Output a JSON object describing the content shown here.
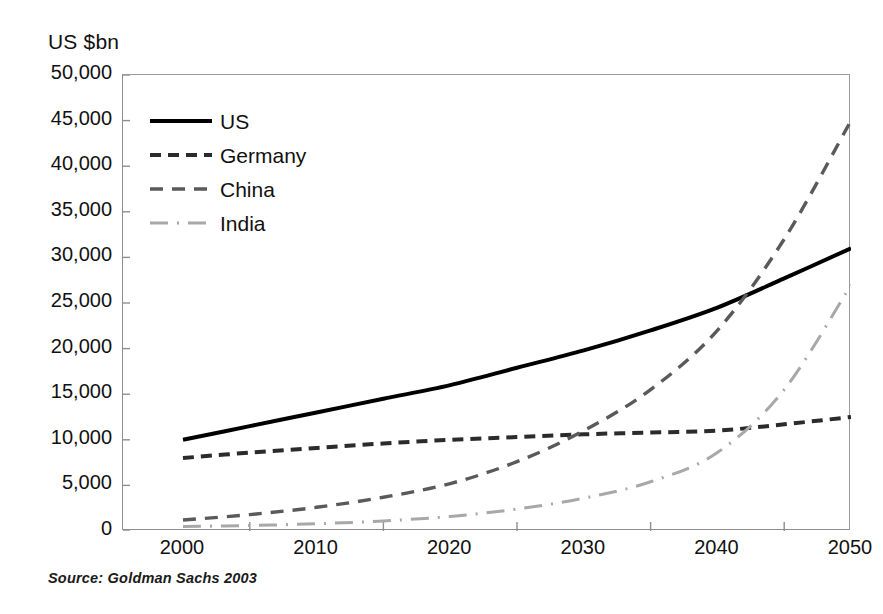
{
  "figure": {
    "y_axis_unit": "US $bn",
    "source_note": "Source:  Goldman Sachs 2003"
  },
  "legend": {
    "items": [
      {
        "label": "US",
        "style": "solid",
        "color": "#000000"
      },
      {
        "label": "Germany",
        "style": "dashed",
        "color": "#2b2b2b"
      },
      {
        "label": "China",
        "style": "dotted",
        "color": "#5a5a5a"
      },
      {
        "label": "India",
        "style": "dash-dot",
        "color": "#a8a8a8"
      }
    ]
  },
  "axes": {
    "y_ticks": [
      "50,000",
      "45,000",
      "40,000",
      "35,000",
      "30,000",
      "25,000",
      "20,000",
      "15,000",
      "10,000",
      "5,000",
      "0"
    ],
    "x_ticks": [
      "2000",
      "2010",
      "2020",
      "2030",
      "2040",
      "2050"
    ]
  },
  "chart_data": {
    "type": "line",
    "title": "",
    "subtitle": "",
    "xlabel": "",
    "ylabel": "US $bn",
    "xlim": [
      2000,
      2050
    ],
    "ylim": [
      0,
      50000
    ],
    "y_tick_step": 5000,
    "x_tick_step": 10,
    "grid": false,
    "legend_position": "upper-left-inside",
    "source": "Source:  Goldman Sachs 2003",
    "x": [
      2000,
      2005,
      2010,
      2015,
      2020,
      2025,
      2030,
      2035,
      2040,
      2045,
      2050
    ],
    "series": [
      {
        "name": "US",
        "line_style": "solid",
        "color": "#000000",
        "values": [
          10000,
          11500,
          13000,
          14500,
          16000,
          17900,
          19800,
          22000,
          24500,
          27700,
          31000
        ]
      },
      {
        "name": "Germany",
        "line_style": "dashed",
        "color": "#2b2b2b",
        "values": [
          8000,
          8600,
          9100,
          9600,
          10000,
          10300,
          10600,
          10800,
          11000,
          11700,
          12500
        ]
      },
      {
        "name": "China",
        "line_style": "dotted",
        "color": "#5a5a5a",
        "values": [
          1200,
          1800,
          2600,
          3700,
          5200,
          7600,
          11000,
          15500,
          22000,
          32000,
          45000
        ]
      },
      {
        "name": "India",
        "line_style": "dash-dot",
        "color": "#a8a8a8",
        "values": [
          500,
          600,
          800,
          1100,
          1600,
          2400,
          3600,
          5400,
          8600,
          15500,
          27000
        ]
      }
    ],
    "annotations": [
      "China overtakes Germany around 2028",
      "China overtakes the US around 2040",
      "India overtakes Germany around 2041"
    ]
  }
}
